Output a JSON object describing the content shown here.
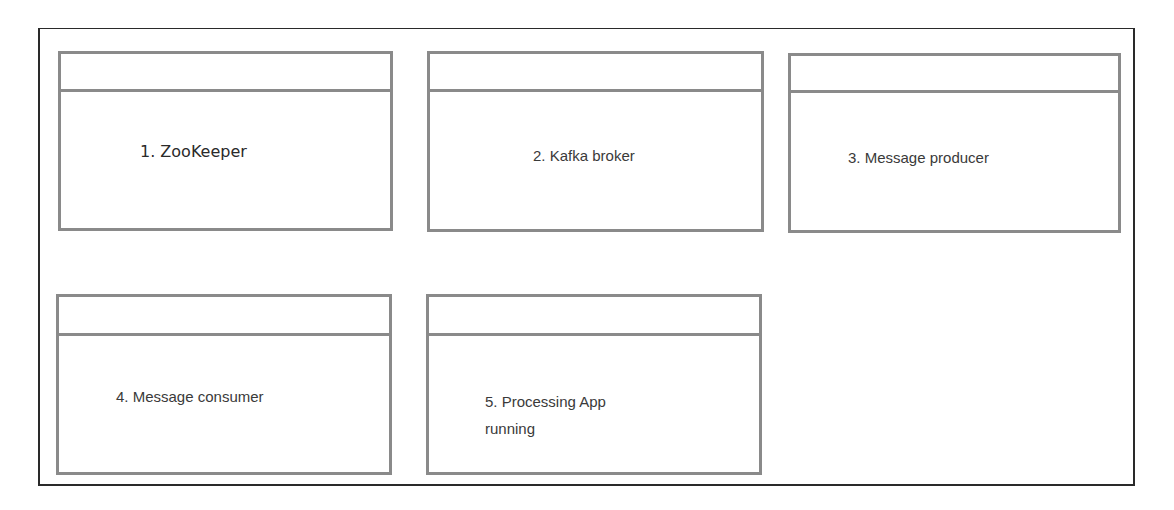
{
  "diagram": {
    "windows": [
      {
        "id": 1,
        "label": "1. ZooKeeper",
        "title": ""
      },
      {
        "id": 2,
        "label": "2. Kafka broker",
        "title": ""
      },
      {
        "id": 3,
        "label": "3. Message producer",
        "title": ""
      },
      {
        "id": 4,
        "label": "4. Message consumer",
        "title": ""
      },
      {
        "id": 5,
        "label_line1": "5. Processing App",
        "label_line2": "running",
        "title": ""
      }
    ],
    "colors": {
      "frame_border": "#2a2a2a",
      "window_border": "#8a8a8a",
      "text": "#3a3a3a",
      "background": "#ffffff"
    }
  }
}
